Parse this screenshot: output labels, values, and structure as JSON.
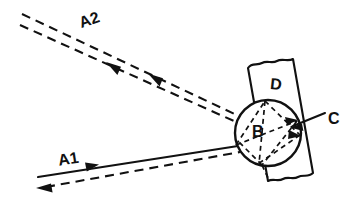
{
  "figure": {
    "kind": "optics-ray-diagram",
    "width": 355,
    "height": 209,
    "background_color": "#ffffff",
    "ink_color": "#111111"
  },
  "labels": {
    "a2": "A2",
    "a1": "A1",
    "b": "B",
    "c": "C",
    "d": "D"
  },
  "elements": {
    "scatterer_disc": {
      "label": "B",
      "center_x": 268,
      "center_y": 133,
      "radius": 33,
      "line_style": "solid"
    },
    "plate": {
      "label": "D",
      "line_style": "solid",
      "edge_style": "torn-wavy",
      "tilt_degrees": 12
    },
    "surface_marker": {
      "label": "C",
      "leader_style": "solid-with-arrowhead"
    },
    "ray_a1": {
      "label": "A1",
      "incident_style": "solid",
      "incident_direction": "right",
      "return_style": "dashed",
      "return_direction": "left"
    },
    "ray_a2": {
      "label": "A2",
      "upper_style": "dashed",
      "upper_direction": "up-left",
      "lower_style": "dashed",
      "lower_direction": "up-left"
    },
    "internal_rays": {
      "style": "dashed",
      "pattern": "star-polygon"
    }
  }
}
